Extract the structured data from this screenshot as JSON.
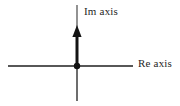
{
  "figure": {
    "kind": "complex-plane-axes-diagram",
    "width": 180,
    "height": 106,
    "background_color": "#ffffff",
    "stroke_color": "#1a1a1a",
    "thin_stroke_color": "#3d3d3d"
  },
  "labels": {
    "imaginary_axis": "Im axis",
    "real_axis": "Re axis"
  },
  "geometry": {
    "origin": {
      "x": 77,
      "y": 66
    },
    "real_axis": {
      "x1": 8,
      "y1": 66,
      "x2": 133,
      "y2": 66,
      "stroke_width": 1.4
    },
    "imaginary_axis_thin_top": {
      "x1": 77,
      "y1": 5,
      "x2": 77,
      "y2": 30,
      "stroke_width": 1.2
    },
    "imaginary_axis_thick": {
      "x1": 77,
      "y1": 30,
      "x2": 77,
      "y2": 66,
      "stroke_width": 3
    },
    "imaginary_axis_thin_bottom": {
      "x1": 77,
      "y1": 66,
      "x2": 77,
      "y2": 101,
      "stroke_width": 1.4
    },
    "arrowhead": {
      "tip_x": 77,
      "tip_y": 25,
      "base_y": 37,
      "half_width": 4.5
    },
    "origin_dot": {
      "cx": 77,
      "cy": 66,
      "r": 3.2
    }
  },
  "icons": {
    "arrow_up": "arrow-up-icon",
    "origin_point": "origin-dot-icon"
  }
}
